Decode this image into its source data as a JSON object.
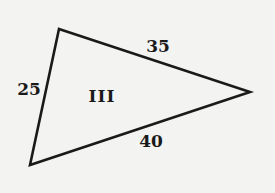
{
  "figure": {
    "region_label": "III",
    "stroke_color": "#1a1a1a",
    "background_color": "#f3f3f1",
    "vertices": {
      "top": [
        59,
        29
      ],
      "right": [
        250,
        92
      ],
      "bottom": [
        30,
        165
      ]
    },
    "sides": [
      {
        "id": "left",
        "label": "25",
        "from": "top",
        "to": "bottom"
      },
      {
        "id": "upper",
        "label": "35",
        "from": "top",
        "to": "right"
      },
      {
        "id": "lower",
        "label": "40",
        "from": "bottom",
        "to": "right"
      }
    ]
  }
}
